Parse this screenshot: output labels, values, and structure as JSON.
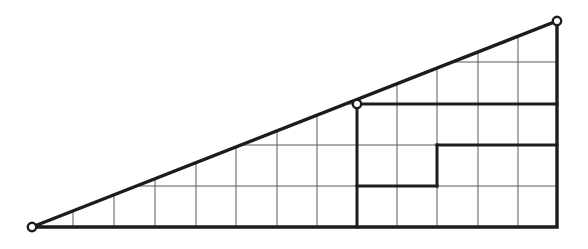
{
  "figure": {
    "type": "geometric-diagram",
    "title": "Right triangle subdivided by a rectangular grid",
    "background_color": "#ffffff",
    "thin_line_color": "#5a5a5a",
    "bold_line_color": "#1c1c1c",
    "vertex_fill_color": "#ffffff",
    "canvas": {
      "width": 588,
      "height": 249
    }
  },
  "geometry": {
    "triangle": {
      "name": "outer-right-triangle",
      "vertices": [
        {
          "name": "left-vertex",
          "x": 32,
          "y": 227,
          "marked": true
        },
        {
          "name": "top-right-vertex",
          "x": 557,
          "y": 21,
          "marked": true
        },
        {
          "name": "bottom-right-vertex",
          "x": 557,
          "y": 227,
          "marked": false
        }
      ],
      "base_length_px": 525,
      "height_px": 206
    },
    "grid": {
      "cell_width_px": 40.4,
      "cell_height_px": 41.2,
      "vertical_lines_x": [
        73,
        114,
        155,
        196,
        236,
        277,
        317,
        357,
        397,
        437,
        478,
        518
      ],
      "horizontal_lines_y": [
        62,
        104,
        145,
        186
      ],
      "bottom_y": 227,
      "right_x": 557,
      "left_apex_x": 32,
      "apex_y": 21
    },
    "bold_segments": [
      {
        "name": "bold-vertical-through-mid-vertex",
        "x1": 357,
        "y1": 104,
        "x2": 357,
        "y2": 227
      },
      {
        "name": "bold-horizontal-upper-right",
        "x1": 357,
        "y1": 104,
        "x2": 557,
        "y2": 104
      },
      {
        "name": "bold-horizontal-middle-right",
        "x1": 437,
        "y1": 145,
        "x2": 557,
        "y2": 145
      },
      {
        "name": "bold-vertical-inner-step",
        "x1": 437,
        "y1": 145,
        "x2": 437,
        "y2": 186
      },
      {
        "name": "bold-horizontal-lower-left",
        "x1": 357,
        "y1": 186,
        "x2": 437,
        "y2": 186
      }
    ]
  },
  "chart_data": {
    "type": "diagram",
    "title": "Right triangle subdivided by a rectangular grid",
    "marked_points": [
      {
        "label": "left vertex",
        "x": 32,
        "y": 227
      },
      {
        "label": "grid point on hypotenuse",
        "x": 357,
        "y": 104
      },
      {
        "label": "apex",
        "x": 557,
        "y": 21
      }
    ],
    "columns": 13,
    "rows": 5
  }
}
